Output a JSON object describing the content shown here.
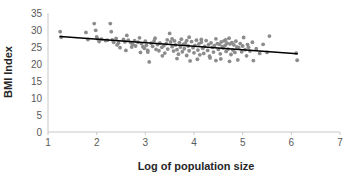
{
  "chart_data": {
    "type": "scatter",
    "title": "",
    "xlabel": "Log of population size",
    "ylabel": "BMI Index",
    "xlim": [
      1,
      7
    ],
    "ylim": [
      0,
      35
    ],
    "xticks": [
      1,
      2,
      3,
      4,
      5,
      6,
      7
    ],
    "yticks": [
      0,
      5,
      10,
      15,
      20,
      25,
      30,
      35
    ],
    "grid": false,
    "legend": null,
    "marker_color": "#8c8c8c",
    "trendline_color": "#000000",
    "axis_color": "#c8c8c8",
    "trendline": {
      "x": [
        1.25,
        6.12
      ],
      "y": [
        28.1,
        23.0
      ],
      "slope": -1.047,
      "intercept": 29.41
    },
    "series": [
      {
        "name": "observations",
        "points": [
          [
            1.25,
            29.5
          ],
          [
            1.27,
            27.9
          ],
          [
            1.78,
            29.3
          ],
          [
            1.82,
            27.2
          ],
          [
            1.95,
            31.9
          ],
          [
            1.98,
            29.9
          ],
          [
            2.0,
            28.0
          ],
          [
            2.02,
            27.4
          ],
          [
            2.05,
            26.6
          ],
          [
            2.1,
            27.3
          ],
          [
            2.18,
            26.9
          ],
          [
            2.22,
            27.0
          ],
          [
            2.28,
            31.9
          ],
          [
            2.3,
            29.5
          ],
          [
            2.32,
            27.1
          ],
          [
            2.35,
            26.4
          ],
          [
            2.4,
            27.5
          ],
          [
            2.45,
            26.2
          ],
          [
            2.48,
            24.8
          ],
          [
            2.55,
            27.2
          ],
          [
            2.58,
            26.5
          ],
          [
            2.62,
            28.4
          ],
          [
            2.65,
            27.0
          ],
          [
            2.7,
            26.3
          ],
          [
            2.74,
            25.8
          ],
          [
            2.78,
            26.9
          ],
          [
            2.8,
            25.3
          ],
          [
            2.85,
            26.4
          ],
          [
            2.88,
            27.7
          ],
          [
            2.92,
            26.0
          ],
          [
            2.95,
            25.1
          ],
          [
            2.98,
            24.6
          ],
          [
            3.0,
            26.7
          ],
          [
            3.02,
            25.5
          ],
          [
            3.05,
            23.5
          ],
          [
            3.08,
            20.6
          ],
          [
            3.12,
            26.1
          ],
          [
            3.15,
            25.2
          ],
          [
            3.18,
            26.8
          ],
          [
            3.22,
            24.3
          ],
          [
            3.25,
            25.7
          ],
          [
            3.28,
            23.9
          ],
          [
            3.3,
            26.2
          ],
          [
            3.34,
            24.9
          ],
          [
            3.38,
            25.4
          ],
          [
            3.4,
            23.2
          ],
          [
            3.43,
            26.0
          ],
          [
            3.46,
            24.4
          ],
          [
            3.5,
            29.0
          ],
          [
            3.52,
            26.5
          ],
          [
            3.55,
            25.1
          ],
          [
            3.58,
            23.8
          ],
          [
            3.6,
            26.8
          ],
          [
            3.62,
            25.6
          ],
          [
            3.65,
            24.2
          ],
          [
            3.68,
            22.9
          ],
          [
            3.7,
            26.3
          ],
          [
            3.72,
            25.0
          ],
          [
            3.74,
            27.3
          ],
          [
            3.76,
            23.6
          ],
          [
            3.78,
            25.8
          ],
          [
            3.8,
            24.5
          ],
          [
            3.82,
            26.1
          ],
          [
            3.85,
            22.5
          ],
          [
            3.88,
            25.3
          ],
          [
            3.9,
            23.9
          ],
          [
            3.92,
            20.9
          ],
          [
            3.95,
            26.6
          ],
          [
            3.98,
            24.8
          ],
          [
            4.0,
            23.3
          ],
          [
            4.02,
            25.5
          ],
          [
            4.05,
            27.0
          ],
          [
            4.08,
            24.1
          ],
          [
            4.1,
            25.9
          ],
          [
            4.12,
            22.7
          ],
          [
            4.15,
            26.4
          ],
          [
            4.18,
            24.6
          ],
          [
            4.2,
            23.1
          ],
          [
            4.22,
            25.2
          ],
          [
            4.25,
            26.9
          ],
          [
            4.28,
            24.0
          ],
          [
            4.3,
            25.7
          ],
          [
            4.32,
            22.3
          ],
          [
            4.35,
            26.2
          ],
          [
            4.38,
            24.9
          ],
          [
            4.4,
            23.5
          ],
          [
            4.42,
            25.4
          ],
          [
            4.45,
            27.4
          ],
          [
            4.48,
            26.0
          ],
          [
            4.5,
            24.3
          ],
          [
            4.52,
            25.8
          ],
          [
            4.54,
            23.0
          ],
          [
            4.56,
            26.5
          ],
          [
            4.58,
            25.1
          ],
          [
            4.6,
            24.7
          ],
          [
            4.62,
            26.8
          ],
          [
            4.64,
            25.5
          ],
          [
            4.66,
            23.7
          ],
          [
            4.68,
            26.1
          ],
          [
            4.7,
            24.4
          ],
          [
            4.72,
            27.6
          ],
          [
            4.74,
            25.9
          ],
          [
            4.76,
            22.8
          ],
          [
            4.78,
            26.3
          ],
          [
            4.8,
            24.1
          ],
          [
            4.82,
            25.6
          ],
          [
            4.84,
            23.4
          ],
          [
            4.86,
            26.7
          ],
          [
            4.88,
            25.0
          ],
          [
            4.9,
            21.2
          ],
          [
            4.92,
            24.8
          ],
          [
            4.95,
            26.0
          ],
          [
            4.98,
            23.6
          ],
          [
            5.0,
            25.3
          ],
          [
            5.02,
            27.8
          ],
          [
            5.05,
            24.2
          ],
          [
            5.08,
            22.4
          ],
          [
            5.1,
            25.7
          ],
          [
            5.15,
            23.8
          ],
          [
            5.2,
            26.4
          ],
          [
            5.22,
            21.0
          ],
          [
            5.28,
            24.5
          ],
          [
            5.35,
            23.1
          ],
          [
            5.42,
            25.8
          ],
          [
            5.5,
            23.4
          ],
          [
            5.55,
            28.2
          ],
          [
            6.1,
            23.2
          ],
          [
            6.12,
            21.1
          ],
          [
            2.6,
            24.0
          ],
          [
            2.9,
            23.4
          ],
          [
            3.35,
            22.4
          ],
          [
            3.65,
            21.6
          ],
          [
            4.07,
            21.4
          ],
          [
            4.33,
            21.8
          ],
          [
            4.55,
            21.5
          ],
          [
            4.73,
            20.8
          ],
          [
            3.2,
            27.6
          ],
          [
            3.45,
            27.1
          ],
          [
            3.9,
            27.9
          ],
          [
            4.45,
            21.0
          ],
          [
            2.72,
            25.0
          ],
          [
            3.05,
            24.0
          ],
          [
            3.55,
            27.4
          ],
          [
            4.15,
            27.2
          ],
          [
            4.65,
            27.1
          ],
          [
            5.12,
            24.9
          ],
          [
            2.42,
            25.6
          ],
          [
            3.85,
            26.9
          ]
        ]
      }
    ]
  },
  "axis_titles": {
    "x": "Log of population size",
    "y": "BMI Index"
  }
}
